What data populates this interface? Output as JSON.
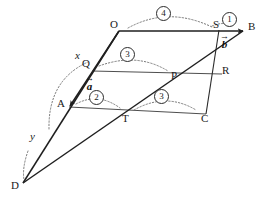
{
  "figure": {
    "type": "geometry-diagram",
    "stroke_color": "#1f1f1f",
    "thin_stroke_color": "#3a3a3a",
    "dotted_color": "#6b6b6b",
    "background": "#ffffff"
  },
  "points": [
    {
      "id": "O",
      "label": "O",
      "x": 113,
      "y": 24,
      "vx": 119,
      "vy": 31
    },
    {
      "id": "S",
      "label": "S",
      "x": 216,
      "y": 24,
      "vx": 219,
      "vy": 30
    },
    {
      "id": "B",
      "label": "B",
      "x": 250,
      "y": 24,
      "vx": 244,
      "vy": 31
    },
    {
      "id": "Q",
      "label": "Q",
      "x": 85,
      "y": 63,
      "vx": 92,
      "vy": 71
    },
    {
      "id": "P",
      "label": "P",
      "x": 174,
      "y": 70,
      "vx": 172,
      "vy": 76
    },
    {
      "id": "R",
      "label": "R",
      "x": 224,
      "y": 67,
      "vx": 222,
      "vy": 74
    },
    {
      "id": "A",
      "label": "A",
      "x": 59,
      "y": 99,
      "vx": 69,
      "vy": 107
    },
    {
      "id": "T",
      "label": "T",
      "x": 124,
      "y": 112,
      "vx": 128,
      "vy": 107
    },
    {
      "id": "C",
      "label": "C",
      "x": 203,
      "y": 112,
      "vx": 206,
      "vy": 107
    },
    {
      "id": "D",
      "label": "D",
      "x": 13,
      "y": 178,
      "vx": 23,
      "vy": 183
    }
  ],
  "angle_labels": [
    {
      "id": "x",
      "label": "x",
      "x": 77,
      "y": 53
    },
    {
      "id": "y",
      "label": "y",
      "x": 32,
      "y": 134
    }
  ],
  "vectors": [
    {
      "id": "a",
      "label": "a",
      "x": 88,
      "y": 80,
      "from": "Q",
      "to": "A"
    },
    {
      "id": "b",
      "label": "b",
      "x": 222,
      "y": 37,
      "from": "S",
      "to": "B"
    }
  ],
  "circled_numbers": [
    {
      "id": "n1",
      "label": "1",
      "x": 228,
      "y": 18,
      "on": "angle at S toward B"
    },
    {
      "id": "n2",
      "label": "2",
      "x": 95,
      "y": 96,
      "on": "angle at A toward T"
    },
    {
      "id": "n3a",
      "label": "3",
      "x": 126,
      "y": 53,
      "on": "angle at Q toward P"
    },
    {
      "id": "n3b",
      "label": "3",
      "x": 160,
      "y": 95,
      "on": "angle at T toward C"
    },
    {
      "id": "n4",
      "label": "4",
      "x": 162,
      "y": 12,
      "on": "angle at O toward S"
    }
  ],
  "segments": [
    {
      "id": "O-B",
      "from": [
        119,
        31
      ],
      "to": [
        244,
        31
      ],
      "weight": "thick"
    },
    {
      "id": "O-A",
      "from": [
        119,
        31
      ],
      "to": [
        69,
        107
      ],
      "weight": "thick"
    },
    {
      "id": "A-C",
      "from": [
        69,
        107
      ],
      "to": [
        206,
        114
      ],
      "weight": "thin"
    },
    {
      "id": "S-C",
      "from": [
        219,
        30
      ],
      "to": [
        206,
        114
      ],
      "weight": "thick"
    },
    {
      "id": "Q-R",
      "from": [
        92,
        71
      ],
      "to": [
        222,
        74
      ],
      "weight": "thin"
    },
    {
      "id": "D-B",
      "from": [
        23,
        183
      ],
      "to": [
        244,
        31
      ],
      "weight": "thick"
    },
    {
      "id": "D-O",
      "from": [
        23,
        183
      ],
      "to": [
        119,
        31
      ],
      "weight": "thick"
    },
    {
      "id": "R-C",
      "from": [
        222,
        74
      ],
      "to": [
        206,
        114
      ],
      "weight": "thin"
    }
  ],
  "arrowheads": [
    {
      "id": "arrow-to-B",
      "at": [
        244,
        31
      ],
      "dir": [
        1,
        0
      ]
    },
    {
      "id": "arrow-to-A",
      "at": [
        69,
        107
      ],
      "dir": [
        -0.55,
        0.84
      ]
    }
  ],
  "dotted_arcs": [
    {
      "id": "arc-4",
      "d": "M 128 28 Q 168 6 212 27"
    },
    {
      "id": "arc-3-upper",
      "d": "M 99 66 Q 137 52 168 71"
    },
    {
      "id": "arc-2",
      "d": "M 76 104 Q 98 92 120 108"
    },
    {
      "id": "arc-3-lower",
      "d": "M 134 110 Q 166 92 196 110"
    },
    {
      "id": "arc-1",
      "d": "M 213 26 Q 226 22 236 27"
    },
    {
      "id": "arc-x",
      "d": "M 49 128 Q 50 82 88 62"
    },
    {
      "id": "arc-y",
      "d": "M 27 150 Q 22 168 24 180"
    }
  ]
}
